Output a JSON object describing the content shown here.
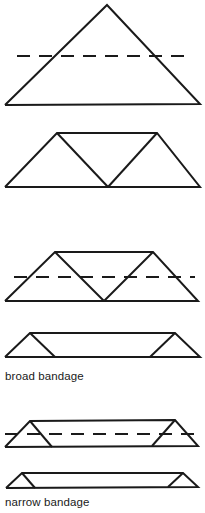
{
  "page": {
    "background": "#ffffff",
    "stroke_color": "#1a1a1a",
    "stroke_width": 2,
    "dash_pattern": "13 9"
  },
  "labels": {
    "broad": "broad bandage",
    "narrow": "narrow bandage"
  },
  "figures": [
    {
      "name": "step1-open-triangle-with-fold-line",
      "solid": [
        [
          [
            5,
            105
          ],
          [
            107,
            5
          ],
          [
            200,
            104
          ],
          [
            5,
            105
          ]
        ]
      ],
      "dashed": [
        [
          [
            17,
            56
          ],
          [
            187,
            56
          ]
        ]
      ]
    },
    {
      "name": "step2-apex-folded-to-base",
      "solid": [
        [
          [
            5,
            187
          ],
          [
            57,
            133
          ],
          [
            157,
            133
          ],
          [
            200,
            187
          ],
          [
            5,
            187
          ]
        ],
        [
          [
            57,
            133
          ],
          [
            108,
            187
          ]
        ],
        [
          [
            157,
            133
          ],
          [
            108,
            187
          ]
        ]
      ],
      "dashed": []
    },
    {
      "name": "step3-trapezoid-with-fold-line",
      "solid": [
        [
          [
            5,
            301
          ],
          [
            55,
            252
          ],
          [
            153,
            252
          ],
          [
            198,
            301
          ],
          [
            5,
            301
          ]
        ],
        [
          [
            55,
            252
          ],
          [
            104,
            301
          ]
        ],
        [
          [
            153,
            252
          ],
          [
            104,
            301
          ]
        ]
      ],
      "dashed": [
        [
          [
            14,
            277
          ],
          [
            195,
            277
          ]
        ]
      ]
    },
    {
      "name": "step4-broad-bandage",
      "solid": [
        [
          [
            5,
            357
          ],
          [
            30,
            333
          ],
          [
            175,
            333
          ],
          [
            200,
            357
          ],
          [
            5,
            357
          ]
        ],
        [
          [
            30,
            333
          ],
          [
            55,
            357
          ]
        ],
        [
          [
            175,
            333
          ],
          [
            150,
            357
          ]
        ]
      ],
      "dashed": []
    },
    {
      "name": "step5-broad-bandage-with-fold-line",
      "solid": [
        [
          [
            5,
            447
          ],
          [
            30,
            421
          ],
          [
            175,
            420
          ],
          [
            198,
            446
          ],
          [
            5,
            447
          ]
        ],
        [
          [
            30,
            421
          ],
          [
            52,
            447
          ]
        ],
        [
          [
            175,
            420
          ],
          [
            152,
            446
          ]
        ]
      ],
      "dashed": [
        [
          [
            5,
            434
          ],
          [
            197,
            434
          ]
        ]
      ]
    },
    {
      "name": "step6-narrow-bandage",
      "solid": [
        [
          [
            6,
            488
          ],
          [
            22,
            473
          ],
          [
            183,
            473
          ],
          [
            198,
            487
          ],
          [
            6,
            488
          ]
        ],
        [
          [
            22,
            473
          ],
          [
            35,
            488
          ]
        ],
        [
          [
            183,
            473
          ],
          [
            168,
            487
          ]
        ]
      ],
      "dashed": []
    }
  ]
}
